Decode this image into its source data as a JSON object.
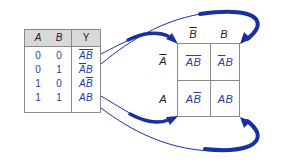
{
  "truth_table": {
    "headers": [
      "A",
      "B",
      "Y"
    ],
    "rows": [
      {
        "A": "0",
        "B": "0",
        "Y": [
          {
            "t": "A",
            "bar": true
          },
          {
            "t": "B",
            "bar": true
          }
        ]
      },
      {
        "A": "0",
        "B": "1",
        "Y": [
          {
            "t": "A",
            "bar": true
          },
          {
            "t": "B",
            "bar": false
          }
        ]
      },
      {
        "A": "1",
        "B": "0",
        "Y": [
          {
            "t": "A",
            "bar": false
          },
          {
            "t": "B",
            "bar": true
          }
        ]
      },
      {
        "A": "1",
        "B": "1",
        "Y": [
          {
            "t": "A",
            "bar": false
          },
          {
            "t": "B",
            "bar": false
          }
        ]
      }
    ]
  },
  "kmap": {
    "column_labels": [
      {
        "t": "B",
        "bar": true
      },
      {
        "t": "B",
        "bar": false
      }
    ],
    "row_labels": [
      {
        "t": "A",
        "bar": true
      },
      {
        "t": "A",
        "bar": false
      }
    ],
    "cells": [
      [
        [
          {
            "t": "A",
            "bar": true
          },
          {
            "t": "B",
            "bar": true
          }
        ],
        [
          {
            "t": "A",
            "bar": true
          },
          {
            "t": "B",
            "bar": false
          }
        ]
      ],
      [
        [
          {
            "t": "A",
            "bar": false
          },
          {
            "t": "B",
            "bar": true
          }
        ],
        [
          {
            "t": "A",
            "bar": false
          },
          {
            "t": "B",
            "bar": false
          }
        ]
      ]
    ]
  },
  "colors": {
    "arrow": "#1a2fa0",
    "expression": "#2b3a9c",
    "grid": "#8a8a8a",
    "header_bg": "#d9d9d9"
  },
  "mapping": [
    {
      "from_row": 0,
      "to_cell": "top-left"
    },
    {
      "from_row": 1,
      "to_cell": "top-right"
    },
    {
      "from_row": 2,
      "to_cell": "bottom-left"
    },
    {
      "from_row": 3,
      "to_cell": "bottom-right"
    }
  ]
}
